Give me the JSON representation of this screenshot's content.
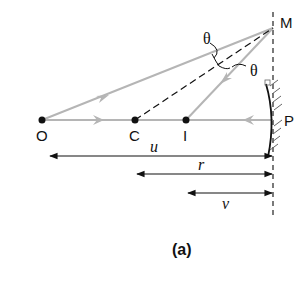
{
  "diagram": {
    "caption": "(a)",
    "points": {
      "O": {
        "label": "O",
        "x": 42,
        "y": 120
      },
      "C": {
        "label": "C",
        "x": 135,
        "y": 120
      },
      "I": {
        "label": "I",
        "x": 186,
        "y": 120
      },
      "P": {
        "label": "P",
        "x": 273,
        "y": 120
      },
      "M": {
        "label": "M",
        "x": 273,
        "y": 28
      }
    },
    "angles": [
      {
        "label": "θ",
        "between": "OM and CM"
      },
      {
        "label": "θ",
        "between": "CM and IM"
      }
    ],
    "distances": [
      {
        "label": "u",
        "from": "O",
        "to": "P"
      },
      {
        "label": "r",
        "from": "C",
        "to": "P"
      },
      {
        "label": "v",
        "from": "I",
        "to": "P"
      }
    ],
    "colors": {
      "ray": "#b5b5b5",
      "line": "#111111",
      "background": "#ffffff"
    }
  }
}
